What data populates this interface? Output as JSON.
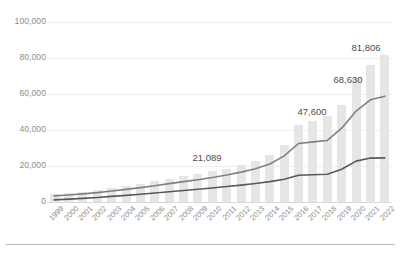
{
  "chart_data": {
    "type": "bar",
    "title": "",
    "subtitle": "",
    "xlabel": "",
    "ylabel": "",
    "ylim": [
      0,
      100000
    ],
    "yticks": [
      0,
      20000,
      40000,
      60000,
      80000,
      100000
    ],
    "ytick_labels": [
      "0",
      "20,000",
      "40,000",
      "60,000",
      "80,000",
      "100,000"
    ],
    "grid": true,
    "legend": "none",
    "categories": [
      "1999",
      "2000",
      "2001",
      "2002",
      "2003",
      "2004",
      "2005",
      "2006",
      "2007",
      "2008",
      "2009",
      "2010",
      "2011",
      "2012",
      "2013",
      "2014",
      "2015",
      "2016",
      "2017",
      "2018",
      "2019",
      "2020",
      "2021",
      "2022"
    ],
    "series": [
      {
        "name": "bars",
        "type": "bar",
        "color": "#e6e6e6",
        "values": [
          4200,
          4800,
          5600,
          6400,
          7600,
          8900,
          10200,
          11500,
          13000,
          14300,
          15600,
          17000,
          18600,
          20400,
          22700,
          26000,
          31500,
          42600,
          44800,
          47600,
          54000,
          68630,
          76000,
          81806
        ]
      },
      {
        "name": "upper-line",
        "type": "line",
        "color": "#808080",
        "values": [
          3400,
          3900,
          4500,
          5200,
          6100,
          7000,
          8000,
          9000,
          10200,
          11300,
          12400,
          13600,
          15000,
          16600,
          18500,
          21089,
          25600,
          32500,
          33400,
          34200,
          41000,
          50500,
          56800,
          58800
        ]
      },
      {
        "name": "lower-line",
        "type": "line",
        "color": "#595959",
        "values": [
          1200,
          1600,
          2000,
          2500,
          3100,
          3700,
          4300,
          5000,
          5700,
          6400,
          7100,
          7800,
          8600,
          9400,
          10300,
          11300,
          12600,
          14900,
          15100,
          15400,
          18200,
          22700,
          24400,
          24500
        ]
      }
    ],
    "annotations": [
      {
        "label": "21,089",
        "x_px": 207,
        "y_px": 152
      },
      {
        "label": "47,600",
        "x_px": 312,
        "y_px": 106
      },
      {
        "label": "68,630",
        "x_px": 348,
        "y_px": 74
      },
      {
        "label": "81,806",
        "x_px": 366,
        "y_px": 42
      }
    ]
  }
}
